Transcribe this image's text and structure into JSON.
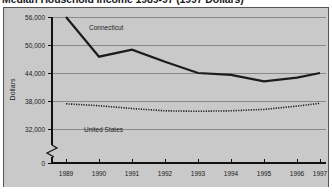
{
  "chart_data": {
    "type": "line",
    "title": "Median Household Income 1989-97 (1997 Dollars)",
    "xlabel": "",
    "ylabel": "Dollars",
    "x": [
      "1989",
      "1990",
      "1991",
      "1992",
      "1993",
      "1994",
      "1995",
      "1996",
      "1997"
    ],
    "categories": [
      "1989",
      "1990",
      "1991",
      "1992",
      "1993",
      "1994",
      "1995",
      "1996",
      "1997"
    ],
    "series": [
      {
        "name": "Connecticut",
        "style": "solid",
        "values": [
          56000,
          47500,
          49000,
          46400,
          44000,
          43600,
          42200,
          43000,
          44000
        ]
      },
      {
        "name": "United States",
        "style": "dotted",
        "values": [
          37400,
          37000,
          36400,
          35900,
          35800,
          35900,
          36200,
          36900,
          37500
        ]
      }
    ],
    "ylim": [
      29000,
      56000
    ],
    "yticks": [
      0,
      32000,
      38000,
      44000,
      50000,
      56000
    ],
    "ytick_labels": [
      "0",
      "32,000",
      "38,000",
      "44,000",
      "50,000",
      "56,000"
    ],
    "y_axis_break": true,
    "grid": true,
    "grid_axis": "y",
    "legend": "inline-annotations",
    "annotations": [
      {
        "text": "Connecticut",
        "near_year": "1990",
        "series": "Connecticut"
      },
      {
        "text": "United States",
        "near_year": "1990",
        "series": "United States"
      }
    ],
    "colors": {
      "plot_background": "#c9c9c9",
      "frame": "#555555",
      "gridline": "#7a7a7a",
      "axis": "#111111",
      "connecticut_line": "#1c1c1c",
      "united_states_line": "#1c1c1c",
      "text": "#1a1a1a",
      "page_background": "#ffffff"
    }
  }
}
